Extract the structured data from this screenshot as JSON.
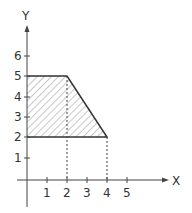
{
  "diagram": {
    "type": "coordinate-plane-region",
    "axes": {
      "x_label": "X",
      "y_label": "Y",
      "x_ticks": [
        "1",
        "2",
        "3",
        "4",
        "5"
      ],
      "y_ticks": [
        "1",
        "2",
        "3",
        "4",
        "5",
        "6"
      ]
    },
    "region": {
      "shape": "trapezoid",
      "fill": "hatched",
      "vertices": [
        [
          0,
          5
        ],
        [
          2,
          5
        ],
        [
          4,
          2
        ],
        [
          0,
          2
        ]
      ]
    },
    "guides": [
      {
        "from": [
          2,
          5
        ],
        "to": [
          2,
          0
        ],
        "style": "dashed"
      },
      {
        "from": [
          4,
          2
        ],
        "to": [
          4,
          0
        ],
        "style": "dashed"
      }
    ],
    "colors": {
      "line": "#333333",
      "hatch": "#666666",
      "background": "#ffffff"
    }
  }
}
